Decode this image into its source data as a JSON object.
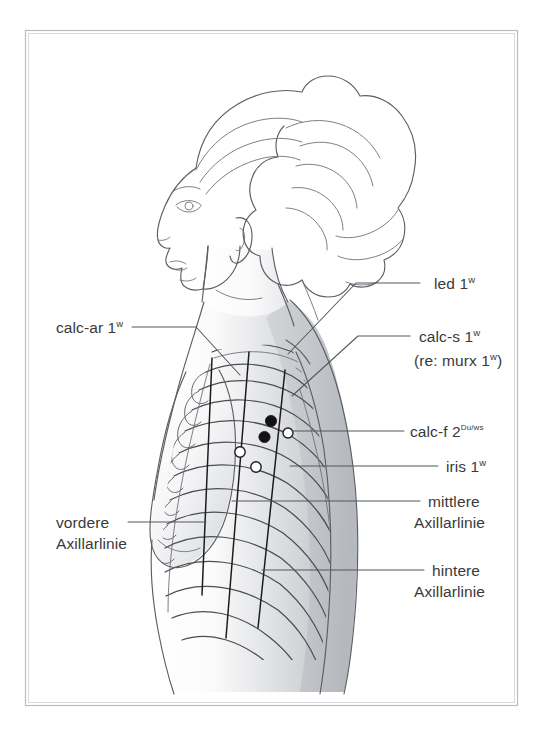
{
  "figure": {
    "background_color": "#ffffff",
    "frame_color": "#b9bcc0",
    "label_color": "#3a3a3a",
    "line_color": "#55565a",
    "point_filled_color": "#121214",
    "point_open_color": "#ffffff"
  },
  "labels": {
    "led": {
      "text": "led 1",
      "sup": "w"
    },
    "calc_s": {
      "text": "calc-s 1",
      "sup": "w"
    },
    "calc_s_note": {
      "text": "(re: murx 1",
      "sup": "w",
      "tail": ")"
    },
    "calc_f": {
      "text": "calc-f 2",
      "sup": "Du/ws"
    },
    "iris": {
      "text": "iris 1",
      "sup": "w"
    },
    "calc_ar": {
      "text": "calc-ar 1",
      "sup": "w"
    },
    "mittlere_axillarlinie": {
      "line1": "mittlere",
      "line2": "Axillarlinie"
    },
    "hintere_axillarlinie": {
      "line1": "hintere",
      "line2": "Axillarlinie"
    },
    "vordere_axillarlinie": {
      "line1": "vordere",
      "line2": "Axillarlinie"
    }
  },
  "points": [
    {
      "id": "calc-s",
      "type": "filled",
      "x": 271,
      "y": 421
    },
    {
      "id": "calc-f",
      "type": "filled",
      "x": 264.5,
      "y": 437
    },
    {
      "id": "iris-right",
      "type": "open",
      "x": 288,
      "y": 433
    },
    {
      "id": "calc-ar",
      "type": "open",
      "x": 240,
      "y": 452
    },
    {
      "id": "iris",
      "type": "open",
      "x": 256,
      "y": 467
    }
  ],
  "axillary_lines": [
    {
      "name": "vordere Axillarlinie",
      "x_top": 212,
      "y_top": 358,
      "x_bottom": 202,
      "y_bottom": 595
    },
    {
      "name": "mittlere Axillarlinie",
      "x_top": 249,
      "y_top": 352,
      "x_bottom": 226,
      "y_bottom": 638
    },
    {
      "name": "hintere Axillarlinie",
      "x_top": 285,
      "y_top": 370,
      "x_bottom": 258,
      "y_bottom": 628
    }
  ]
}
